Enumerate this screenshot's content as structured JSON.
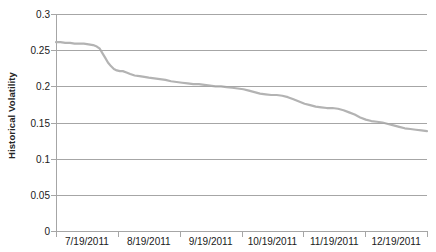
{
  "chart_data": {
    "type": "line",
    "title": "",
    "xlabel": "",
    "ylabel": "Historical Volatility",
    "ylim": [
      0,
      0.3
    ],
    "ytick_labels": [
      "0.3",
      "0.25",
      "0.2",
      "0.15",
      "0.1",
      "0.05",
      "0"
    ],
    "ytick_values": [
      0.3,
      0.25,
      0.2,
      0.15,
      0.1,
      0.05,
      0
    ],
    "grid": "horizontal",
    "legend": "none",
    "line_color": "#b3b3b3",
    "gridline_color": "#a6a6a6",
    "axis_color": "#a6a6a6",
    "text_color": "#202020",
    "xtick_labels": [
      "7/19/2011",
      "8/19/2011",
      "9/19/2011",
      "10/19/2011",
      "11/19/2011",
      "12/19/2011"
    ],
    "xlim_labels": [
      "7/19/2011",
      "1/19/2012"
    ],
    "series": [
      {
        "name": "Historical Volatility",
        "x": [
          0.0,
          0.012,
          0.025,
          0.038,
          0.05,
          0.062,
          0.075,
          0.088,
          0.1,
          0.11,
          0.118,
          0.125,
          0.132,
          0.14,
          0.148,
          0.156,
          0.164,
          0.172,
          0.18,
          0.19,
          0.2,
          0.212,
          0.225,
          0.238,
          0.25,
          0.265,
          0.28,
          0.295,
          0.31,
          0.325,
          0.34,
          0.355,
          0.37,
          0.385,
          0.4,
          0.415,
          0.43,
          0.445,
          0.46,
          0.475,
          0.49,
          0.505,
          0.52,
          0.535,
          0.55,
          0.565,
          0.58,
          0.595,
          0.61,
          0.625,
          0.64,
          0.655,
          0.67,
          0.685,
          0.7,
          0.715,
          0.73,
          0.745,
          0.76,
          0.775,
          0.79,
          0.805,
          0.82,
          0.835,
          0.85,
          0.865,
          0.88,
          0.895,
          0.91,
          0.925,
          0.94,
          0.955,
          0.97,
          0.985,
          1.0
        ],
        "y": [
          0.261,
          0.261,
          0.26,
          0.26,
          0.259,
          0.259,
          0.259,
          0.258,
          0.257,
          0.255,
          0.252,
          0.246,
          0.24,
          0.233,
          0.228,
          0.224,
          0.222,
          0.221,
          0.221,
          0.219,
          0.217,
          0.215,
          0.214,
          0.213,
          0.212,
          0.211,
          0.21,
          0.209,
          0.207,
          0.206,
          0.205,
          0.204,
          0.203,
          0.203,
          0.202,
          0.201,
          0.2,
          0.2,
          0.199,
          0.198,
          0.197,
          0.196,
          0.194,
          0.192,
          0.19,
          0.189,
          0.188,
          0.188,
          0.187,
          0.185,
          0.182,
          0.179,
          0.176,
          0.174,
          0.172,
          0.171,
          0.17,
          0.17,
          0.169,
          0.167,
          0.164,
          0.161,
          0.157,
          0.154,
          0.152,
          0.151,
          0.15,
          0.148,
          0.146,
          0.144,
          0.142,
          0.141,
          0.14,
          0.139,
          0.138
        ]
      }
    ]
  },
  "axis": {
    "y_title": "Historical Volatility"
  }
}
